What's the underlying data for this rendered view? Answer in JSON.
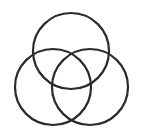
{
  "diagram": {
    "type": "venn",
    "sets": 3,
    "stroke_color": "#2a2a2a",
    "background": "#ffffff",
    "circles": [
      {
        "name": "top",
        "cx": 71,
        "cy": 51,
        "r": 38
      },
      {
        "name": "left",
        "cx": 53,
        "cy": 87,
        "r": 38
      },
      {
        "name": "right",
        "cx": 90,
        "cy": 87,
        "r": 38
      }
    ]
  }
}
